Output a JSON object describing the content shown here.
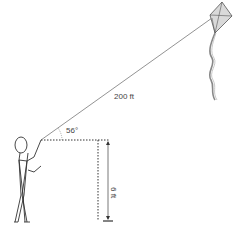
{
  "diagram": {
    "string_length_label": "200 ft",
    "angle_label": "56°",
    "height_label": "6 ft",
    "colors": {
      "line": "#555555",
      "kite_fill": "#d9d9d9",
      "tail": "#888888"
    }
  }
}
